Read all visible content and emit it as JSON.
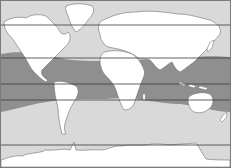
{
  "map": {
    "type": "world-map-equirectangular",
    "colors": {
      "ocean": "#d9d9d9",
      "warm_band": "#8f8f8f",
      "land": "#ffffff",
      "coastline": "#6e6e6e",
      "latitude_line": "#3a3a3a",
      "border": "#7a7a7a"
    },
    "latitude_lines_y": [
      25,
      58,
      84,
      100,
      145
    ],
    "regions": [
      {
        "name": "tropical-warm-water-band",
        "description": "darker shaded zone spanning tropics"
      },
      {
        "name": "temperate-ocean",
        "description": "light gray ocean"
      },
      {
        "name": "antarctic-coast",
        "description": "bottom coastline"
      }
    ],
    "continents": [
      "North America",
      "South America",
      "Europe",
      "Africa",
      "Asia",
      "Australia",
      "Greenland",
      "Antarctica"
    ]
  }
}
